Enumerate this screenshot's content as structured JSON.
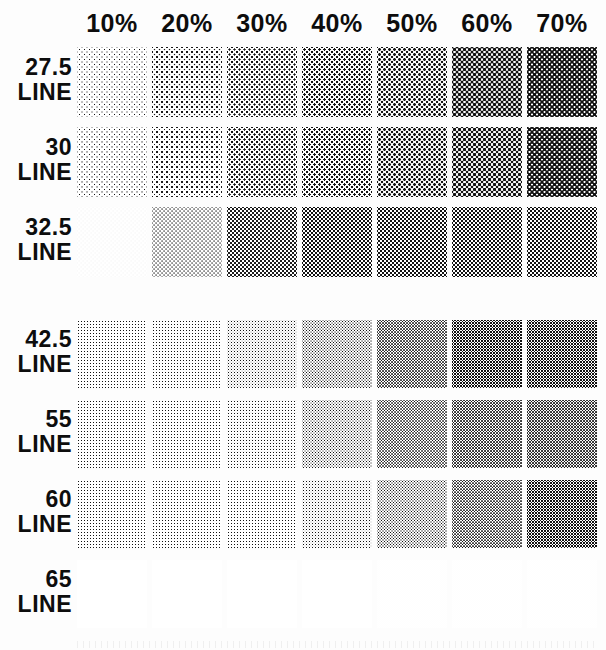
{
  "document": {
    "title": "Halftone Screen Test Chart",
    "background_color": "#fdfdfd",
    "ink_color": "#0d0d0d"
  },
  "chart_data": {
    "type": "heatmap",
    "title": "",
    "subtitle": "",
    "xlabel": "",
    "ylabel": "",
    "legend_position": "none",
    "grid": false,
    "row_axis_name": "Screen ruling",
    "row_unit": "LINE",
    "column_axis_name": "Tint percentage",
    "categories": [
      "10%",
      "20%",
      "30%",
      "40%",
      "50%",
      "60%",
      "70%"
    ],
    "column_values": [
      10,
      20,
      30,
      40,
      50,
      60,
      70
    ],
    "rows": [
      "27.5",
      "30",
      "32.5",
      "42.5",
      "55",
      "60",
      "65"
    ],
    "row_values": [
      27.5,
      30,
      32.5,
      42.5,
      55,
      60,
      65
    ],
    "values": [
      [
        10,
        20,
        30,
        40,
        50,
        60,
        70
      ],
      [
        10,
        20,
        30,
        40,
        50,
        60,
        70
      ],
      [
        10,
        20,
        30,
        40,
        50,
        60,
        70
      ],
      [
        10,
        20,
        30,
        40,
        50,
        60,
        70
      ],
      [
        10,
        20,
        30,
        40,
        50,
        60,
        70
      ],
      [
        10,
        20,
        30,
        40,
        50,
        60,
        70
      ],
      [
        10,
        20,
        30,
        40,
        50,
        60,
        70
      ]
    ]
  },
  "columns": [
    {
      "label": "10%",
      "tint": 10
    },
    {
      "label": "20%",
      "tint": 20
    },
    {
      "label": "30%",
      "tint": 30
    },
    {
      "label": "40%",
      "tint": 40
    },
    {
      "label": "50%",
      "tint": 50
    },
    {
      "label": "60%",
      "tint": 60
    },
    {
      "label": "70%",
      "tint": 70
    }
  ],
  "rows": [
    {
      "value": "27.5",
      "unit": "LINE",
      "lpi": 27.5
    },
    {
      "value": "30",
      "unit": "LINE",
      "lpi": 30
    },
    {
      "value": "32.5",
      "unit": "LINE",
      "lpi": 32.5
    },
    {
      "value": "42.5",
      "unit": "LINE",
      "lpi": 42.5
    },
    {
      "value": "55",
      "unit": "LINE",
      "lpi": 55
    },
    {
      "value": "60",
      "unit": "LINE",
      "lpi": 60
    },
    {
      "value": "65",
      "unit": "LINE",
      "lpi": 65
    }
  ]
}
